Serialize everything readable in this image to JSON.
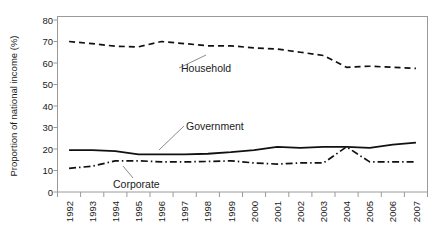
{
  "chart_data": {
    "type": "line",
    "title": "",
    "xlabel": "",
    "ylabel": "Proportion of national income (%)",
    "ylim": [
      0,
      80
    ],
    "yticks": [
      0,
      10,
      20,
      30,
      40,
      50,
      60,
      70,
      80
    ],
    "grid": false,
    "legend_position": "inline-annotations",
    "categories": [
      "1992",
      "1993",
      "1994",
      "1995",
      "1996",
      "1997",
      "1998",
      "1999",
      "2000",
      "2001",
      "2002",
      "2003",
      "2004",
      "2005",
      "2006",
      "2007"
    ],
    "series": [
      {
        "name": "Household",
        "style": "dashed",
        "values": [
          70.0,
          69.0,
          67.8,
          67.5,
          70.0,
          69.0,
          68.0,
          68.0,
          67.0,
          66.5,
          65.0,
          63.5,
          58.0,
          58.5,
          58.0,
          57.5
        ]
      },
      {
        "name": "Government",
        "style": "solid",
        "values": [
          19.5,
          19.5,
          19.0,
          17.5,
          17.5,
          17.5,
          17.8,
          18.5,
          19.5,
          21.0,
          20.5,
          21.0,
          21.0,
          20.5,
          22.0,
          23.0
        ]
      },
      {
        "name": "Corporate",
        "style": "dash-dot",
        "values": [
          11.0,
          12.0,
          14.5,
          14.5,
          14.0,
          14.0,
          14.2,
          14.5,
          13.5,
          13.0,
          13.5,
          13.5,
          21.0,
          14.0,
          14.0,
          14.0
        ]
      }
    ]
  },
  "annotations": {
    "household_label": "Household",
    "government_label": "Government",
    "corporate_label": "Corporate"
  },
  "axes": {
    "y_title": "Proportion of national income (%)",
    "y_tick_labels": [
      "80",
      "70",
      "60",
      "50",
      "40",
      "30",
      "20",
      "10",
      "0"
    ],
    "x_tick_labels": [
      "1992",
      "1993",
      "1994",
      "1995",
      "1996",
      "1997",
      "1998",
      "1999",
      "2000",
      "2001",
      "2002",
      "2003",
      "2004",
      "2005",
      "2006",
      "2007"
    ]
  },
  "colors": {
    "line": "#111111",
    "frame": "#9a9a9a",
    "text": "#1a1a1a",
    "background": "#ffffff"
  }
}
